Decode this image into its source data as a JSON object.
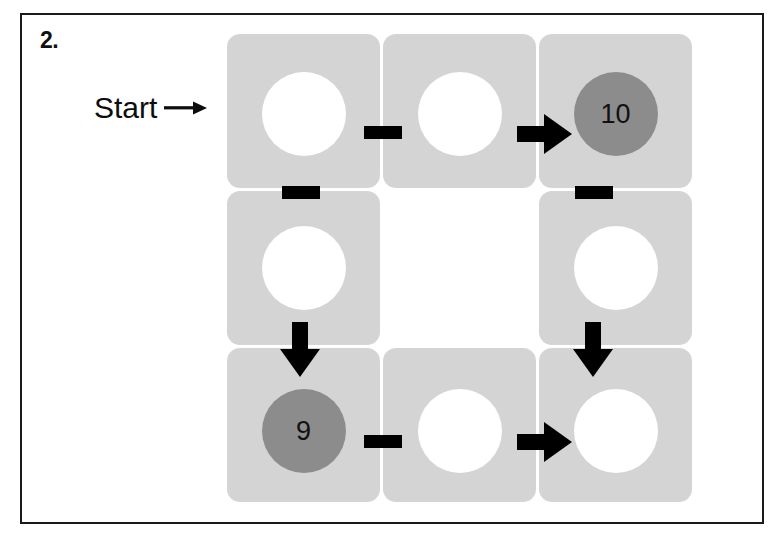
{
  "problem": {
    "number": "2."
  },
  "start_marker": {
    "label": "Start",
    "arrow_icon": "arrow-right-thin-icon"
  },
  "colors": {
    "page_background": "#ffffff",
    "frame_border": "#1a1a1a",
    "card_gray": "#d4d4d4",
    "filled_circle_gray": "#8c8c8c",
    "blank_circle": "#ffffff",
    "glyph_black": "#000000"
  },
  "board": {
    "rows": 3,
    "columns": 3,
    "cells": [
      {
        "position": "top-left",
        "circle": {
          "type": "blank",
          "value": ""
        }
      },
      {
        "position": "top-center",
        "circle": {
          "type": "blank",
          "value": ""
        }
      },
      {
        "position": "top-right",
        "circle": {
          "type": "filled",
          "value": "10"
        }
      },
      {
        "position": "middle-left",
        "circle": {
          "type": "blank",
          "value": ""
        }
      },
      {
        "position": "middle-center",
        "circle": {
          "type": "none",
          "value": ""
        }
      },
      {
        "position": "middle-right",
        "circle": {
          "type": "blank",
          "value": ""
        }
      },
      {
        "position": "bottom-left",
        "circle": {
          "type": "filled",
          "value": "9"
        }
      },
      {
        "position": "bottom-center",
        "circle": {
          "type": "blank",
          "value": ""
        }
      },
      {
        "position": "bottom-right",
        "circle": {
          "type": "blank",
          "value": ""
        }
      }
    ],
    "operators": [
      {
        "glyph": "minus",
        "between": "top-left to top-center"
      },
      {
        "glyph": "arrow-right",
        "between": "top-center to top-right"
      },
      {
        "glyph": "minus",
        "between": "top-left to middle-left"
      },
      {
        "glyph": "minus",
        "between": "top-right to middle-right"
      },
      {
        "glyph": "arrow-down",
        "between": "middle-left to bottom-left"
      },
      {
        "glyph": "arrow-down",
        "between": "middle-right to bottom-right"
      },
      {
        "glyph": "minus",
        "between": "bottom-left to bottom-center"
      },
      {
        "glyph": "arrow-right",
        "between": "bottom-center to bottom-right"
      }
    ]
  }
}
